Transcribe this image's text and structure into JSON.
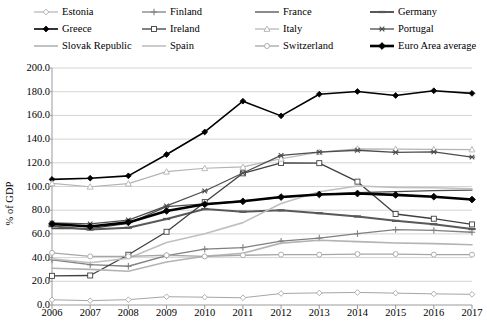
{
  "legend": {
    "rows": [
      [
        {
          "label": "Estonia",
          "marker": "diamond-open",
          "color": "#a6a6a6",
          "width": 1.0
        },
        {
          "label": "Finland",
          "marker": "plus",
          "color": "#808080",
          "width": 1.3
        },
        {
          "label": "France",
          "marker": "none",
          "color": "#4d4d4d",
          "width": 1.3
        },
        {
          "label": "Germany",
          "marker": "dash",
          "color": "#595959",
          "width": 2.0
        }
      ],
      [
        {
          "label": "Greece",
          "marker": "diamond-filled",
          "color": "#000000",
          "width": 1.6
        },
        {
          "label": "Ireland",
          "marker": "square-open",
          "color": "#404040",
          "width": 1.3
        },
        {
          "label": "Italy",
          "marker": "triangle-open",
          "color": "#b3b3b3",
          "width": 1.2
        },
        {
          "label": "Portugal",
          "marker": "star",
          "color": "#4d4d4d",
          "width": 1.3
        }
      ],
      [
        {
          "label": "Slovak Republic",
          "marker": "none",
          "color": "#b3b3b3",
          "width": 1.6
        },
        {
          "label": "Spain",
          "marker": "none",
          "color": "#bfbfbf",
          "width": 1.6
        },
        {
          "label": "Switzerland",
          "marker": "circle-open",
          "color": "#a6a6a6",
          "width": 1.3
        },
        {
          "label": "Euro Area average",
          "marker": "diamond-filled-lg",
          "color": "#000000",
          "width": 2.6
        }
      ]
    ]
  },
  "chart_data": {
    "type": "line",
    "title": "",
    "xlabel": "",
    "ylabel": "% of GDP",
    "categories": [
      "2006",
      "2007",
      "2008",
      "2009",
      "2010",
      "2011",
      "2012",
      "2013",
      "2014",
      "2015",
      "2016",
      "2017"
    ],
    "ylim": [
      0,
      200
    ],
    "ytick_step": 20,
    "yticks": [
      "0.0",
      "20.0",
      "40.0",
      "60.0",
      "80.0",
      "100.0",
      "120.0",
      "140.0",
      "160.0",
      "180.0",
      "200.0"
    ],
    "grid": true,
    "legend_position": "top",
    "series": [
      {
        "name": "Estonia",
        "marker": "diamond-open",
        "color": "#a6a6a6",
        "width": 1.0,
        "values": [
          4.4,
          3.7,
          4.5,
          7.0,
          6.6,
          6.1,
          9.7,
          10.2,
          10.6,
          10.0,
          9.4,
          9.0
        ]
      },
      {
        "name": "Finland",
        "marker": "plus",
        "color": "#808080",
        "width": 1.3,
        "values": [
          38.2,
          34.0,
          32.7,
          41.7,
          47.1,
          48.5,
          53.9,
          56.5,
          60.2,
          63.6,
          63.0,
          61.4
        ]
      },
      {
        "name": "France",
        "marker": "none",
        "color": "#4d4d4d",
        "width": 1.3,
        "values": [
          64.5,
          64.5,
          68.8,
          83.0,
          85.3,
          87.8,
          90.6,
          93.4,
          94.9,
          95.6,
          96.6,
          97.0
        ]
      },
      {
        "name": "Germany",
        "marker": "dash",
        "color": "#595959",
        "width": 2.0,
        "values": [
          66.5,
          63.7,
          65.2,
          72.6,
          81.0,
          78.7,
          79.9,
          77.5,
          74.7,
          71.0,
          68.2,
          64.1
        ]
      },
      {
        "name": "Greece",
        "marker": "diamond-filled",
        "color": "#000000",
        "width": 1.6,
        "values": [
          106.0,
          107.0,
          109.0,
          127.0,
          146.0,
          172.0,
          159.6,
          177.9,
          180.2,
          176.8,
          180.8,
          178.6
        ]
      },
      {
        "name": "Ireland",
        "marker": "square-open",
        "color": "#404040",
        "width": 1.3,
        "values": [
          24.6,
          24.9,
          42.4,
          61.8,
          86.8,
          111.1,
          119.9,
          119.7,
          104.1,
          76.8,
          72.8,
          68.0
        ]
      },
      {
        "name": "Italy",
        "marker": "triangle-open",
        "color": "#b3b3b3",
        "width": 1.2,
        "values": [
          102.6,
          99.8,
          102.4,
          112.5,
          115.4,
          116.5,
          123.4,
          129.0,
          131.8,
          131.6,
          131.4,
          131.2
        ]
      },
      {
        "name": "Portugal",
        "marker": "star",
        "color": "#4d4d4d",
        "width": 1.3,
        "values": [
          69.2,
          68.4,
          71.7,
          83.6,
          96.2,
          111.4,
          126.2,
          129.0,
          130.6,
          128.8,
          129.2,
          124.8
        ]
      },
      {
        "name": "Slovak Republic",
        "marker": "none",
        "color": "#b3b3b3",
        "width": 1.6,
        "values": [
          31.0,
          30.1,
          28.5,
          36.3,
          41.2,
          43.7,
          52.2,
          54.7,
          53.5,
          52.3,
          51.8,
          50.9
        ]
      },
      {
        "name": "Spain",
        "marker": "none",
        "color": "#bfbfbf",
        "width": 1.6,
        "values": [
          38.9,
          35.6,
          39.5,
          52.8,
          60.1,
          69.5,
          85.7,
          95.5,
          100.4,
          99.3,
          99.0,
          98.1
        ]
      },
      {
        "name": "Switzerland",
        "marker": "circle-open",
        "color": "#a6a6a6",
        "width": 1.3,
        "values": [
          44.0,
          41.0,
          41.0,
          42.0,
          41.0,
          42.0,
          42.5,
          42.5,
          43.0,
          43.0,
          42.5,
          42.5
        ]
      },
      {
        "name": "Euro Area average",
        "marker": "diamond-filled-lg",
        "color": "#000000",
        "width": 2.6,
        "values": [
          68.4,
          66.2,
          69.7,
          79.4,
          85.0,
          87.5,
          91.1,
          93.3,
          94.1,
          92.9,
          91.4,
          89.0
        ]
      }
    ]
  }
}
